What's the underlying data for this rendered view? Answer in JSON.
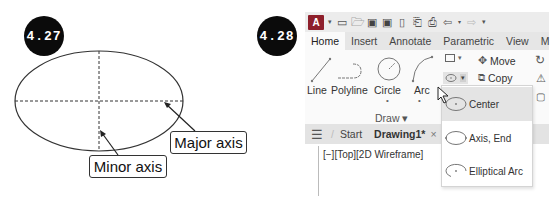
{
  "figure_427": {
    "badge": "4.27",
    "labels": {
      "major_axis": "Major axis",
      "minor_axis": "Minor axis"
    }
  },
  "figure_428": {
    "badge": "4.28",
    "app_logo": "A",
    "quick_access_icons": [
      "new-icon",
      "open-icon",
      "save-icon",
      "save-as-icon",
      "plot-preview-icon",
      "publish-icon",
      "print-icon",
      "undo-icon",
      "redo-icon",
      "customize-icon"
    ],
    "ribbon_tabs": [
      "Home",
      "Insert",
      "Annotate",
      "Parametric",
      "View",
      "M"
    ],
    "active_tab": "Home",
    "draw_tools": [
      "Line",
      "Polyline",
      "Circle",
      "Arc"
    ],
    "draw_panel_title": "Draw ▾",
    "modify_tools": [
      "Move",
      "Copy"
    ],
    "document_tabs": {
      "start": "Start",
      "drawing": "Drawing1*",
      "close": "×"
    },
    "viewport_label": "[−][Top][2D Wireframe]",
    "ellipse_menu": [
      {
        "label": "Center",
        "highlighted": true
      },
      {
        "label": "Axis, End",
        "highlighted": false
      },
      {
        "label": "Elliptical Arc",
        "highlighted": false
      }
    ]
  }
}
